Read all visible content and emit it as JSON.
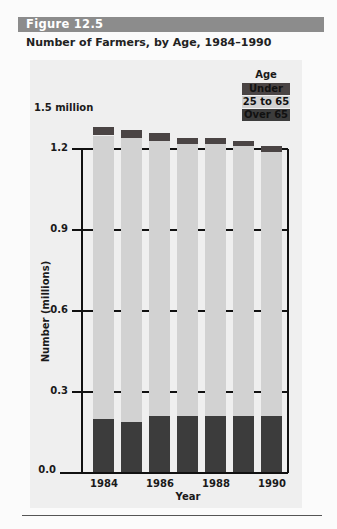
{
  "figure": {
    "label": "Figure 12.5",
    "title": "Number of Farmers, by Age, 1984–1990"
  },
  "colors": {
    "header": "#8c8c8c",
    "under25": "#4a4444",
    "age25to65": "#d2d2d2",
    "over65": "#3c3c3c"
  },
  "legend": {
    "title": "Age",
    "items": [
      "Under 25",
      "25 to 65",
      "Over 65"
    ]
  },
  "axes": {
    "y_unit_label": "1.5 million",
    "y_label": "Number (millions)",
    "y_ticks": [
      "1.2",
      "0.9",
      "0.6",
      "0.3",
      "0.0"
    ],
    "x_label": "Year",
    "x_ticks": [
      "1984",
      "1986",
      "1988",
      "1990"
    ]
  },
  "chart_data": {
    "type": "bar",
    "stacked": true,
    "title": "Number of Farmers, by Age, 1984–1990",
    "xlabel": "Year",
    "ylabel": "Number (millions)",
    "ylim": [
      0,
      1.5
    ],
    "y_ticks": [
      0.0,
      0.3,
      0.6,
      0.9,
      1.2
    ],
    "grid": true,
    "legend_position": "top-right",
    "categories": [
      "1984",
      "1985",
      "1986",
      "1987",
      "1988",
      "1989",
      "1990"
    ],
    "series": [
      {
        "name": "Over 65",
        "values": [
          0.2,
          0.19,
          0.21,
          0.21,
          0.21,
          0.21,
          0.21
        ]
      },
      {
        "name": "25 to 65",
        "values": [
          1.05,
          1.05,
          1.02,
          1.01,
          1.01,
          1.0,
          0.98
        ]
      },
      {
        "name": "Under 25",
        "values": [
          0.03,
          0.03,
          0.03,
          0.02,
          0.02,
          0.02,
          0.02
        ]
      }
    ],
    "totals": [
      1.28,
      1.27,
      1.26,
      1.24,
      1.24,
      1.23,
      1.21
    ]
  }
}
